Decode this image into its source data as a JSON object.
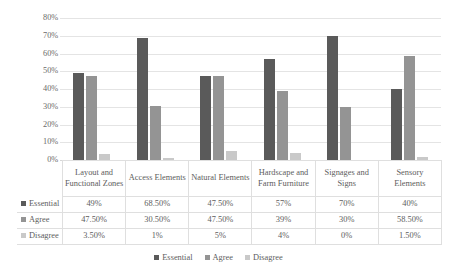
{
  "chart_data": {
    "type": "bar",
    "title": "",
    "xlabel": "",
    "ylabel": "",
    "ylim": [
      0,
      80
    ],
    "ytick_labels": [
      "0%",
      "10%",
      "20%",
      "30%",
      "40%",
      "50%",
      "60%",
      "70%",
      "80%"
    ],
    "ytick_values": [
      0,
      10,
      20,
      30,
      40,
      50,
      60,
      70,
      80
    ],
    "grid": true,
    "legend_position": "bottom",
    "categories": [
      "Layout and Functional Zones",
      "Access Elements",
      "Natural Elements",
      "Hardscape and Farm Furniture",
      "Signages and Signs",
      "Sensory Elements"
    ],
    "series": [
      {
        "name": "Essential",
        "color": "#5a5a5a",
        "values": [
          49,
          68.5,
          47.5,
          57,
          70,
          40
        ],
        "labels": [
          "49%",
          "68.50%",
          "47.50%",
          "57%",
          "70%",
          "40%"
        ]
      },
      {
        "name": "Agree",
        "color": "#949494",
        "values": [
          47.5,
          30.5,
          47.5,
          39,
          30,
          58.5
        ],
        "labels": [
          "47.50%",
          "30.50%",
          "47.50%",
          "39%",
          "30%",
          "58.50%"
        ]
      },
      {
        "name": "Disagree",
        "color": "#c9c9c9",
        "values": [
          3.5,
          1,
          5,
          4,
          0,
          1.5
        ],
        "labels": [
          "3.50%",
          "1%",
          "5%",
          "4%",
          "0%",
          "1.50%"
        ]
      }
    ]
  },
  "data_table": {
    "corner_label": "",
    "column_headers": [
      "Layout and Functional Zones",
      "Access Elements",
      "Natural Elements",
      "Hardscape and Farm Furniture",
      "Signages and Signs",
      "Sensory Elements"
    ],
    "rows": [
      {
        "label": "Essential",
        "swatch": "#5a5a5a",
        "values": [
          "49%",
          "68.50%",
          "47.50%",
          "57%",
          "70%",
          "40%"
        ]
      },
      {
        "label": "Agree",
        "swatch": "#949494",
        "values": [
          "47.50%",
          "30.50%",
          "47.50%",
          "39%",
          "30%",
          "58.50%"
        ]
      },
      {
        "label": "Disagree",
        "swatch": "#c9c9c9",
        "values": [
          "3.50%",
          "1%",
          "5%",
          "4%",
          "0%",
          "1.50%"
        ]
      }
    ]
  },
  "legend": {
    "items": [
      {
        "label": "Essential",
        "color": "#5a5a5a"
      },
      {
        "label": "Agree",
        "color": "#949494"
      },
      {
        "label": "Disagree",
        "color": "#c9c9c9"
      }
    ]
  }
}
